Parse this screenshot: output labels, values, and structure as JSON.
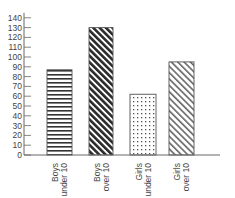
{
  "chart_data": {
    "type": "bar",
    "title": "",
    "xlabel": "",
    "ylabel": "",
    "categories": [
      "Boys under 10",
      "Boys over 10",
      "Girls under 10",
      "Girls over 10"
    ],
    "category_lines": [
      [
        "Boys",
        "under 10"
      ],
      [
        "Boys",
        "over 10"
      ],
      [
        "Girls",
        "under 10"
      ],
      [
        "Girls",
        "over 10"
      ]
    ],
    "values": [
      87,
      130,
      62,
      95
    ],
    "patterns": [
      "horizontal-lines",
      "dense-diagonal",
      "dots",
      "light-diagonal"
    ],
    "ylim": [
      0,
      145
    ],
    "yticks": [
      0,
      10,
      20,
      30,
      40,
      50,
      60,
      70,
      80,
      90,
      100,
      110,
      120,
      130,
      140
    ],
    "grid": false,
    "legend": null
  },
  "colors": {
    "axis": "#666666",
    "bar_border": "#555555",
    "pattern_dark": "#333333",
    "pattern_light": "#777777"
  }
}
